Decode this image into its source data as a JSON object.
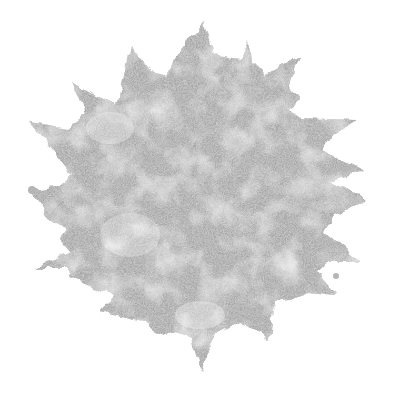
{
  "image": {
    "subject": "grunge-sun-starburst",
    "background_color": "#ffffff",
    "fill_color": "#a8a8a8",
    "light_fill_color": "#c4c4c4"
  }
}
